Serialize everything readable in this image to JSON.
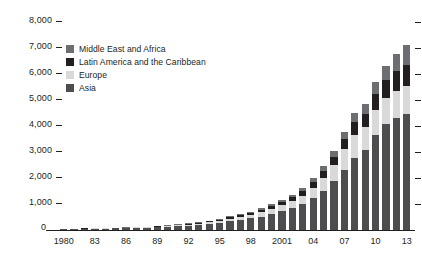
{
  "chart_data": {
    "type": "bar",
    "stacked": true,
    "title": "",
    "subtitle": "",
    "xlabel": "",
    "ylabel": "",
    "ylim": [
      0,
      8000
    ],
    "ytick_values": [
      1000,
      2000,
      3000,
      4000,
      5000,
      6000,
      7000,
      8000
    ],
    "ytick_labels": [
      "1,000",
      "2,000",
      "3,000",
      "4,000",
      "5,000",
      "6,000",
      "7,000",
      "8,000"
    ],
    "zero_label": "0",
    "grid": false,
    "ticks_both_sides": true,
    "legend_position": "upper-left-inside",
    "categories": [
      "1980",
      "1981",
      "1982",
      "1983",
      "1984",
      "1985",
      "1986",
      "1987",
      "1988",
      "1989",
      "1990",
      "1991",
      "1992",
      "1993",
      "1994",
      "1995",
      "1996",
      "1997",
      "1998",
      "1999",
      "2000",
      "2001",
      "2002",
      "2003",
      "2004",
      "2005",
      "2006",
      "2007",
      "2008",
      "2009",
      "2010",
      "2011",
      "2012",
      "2013"
    ],
    "xtick_labels": [
      {
        "index": 0,
        "label": "1980"
      },
      {
        "index": 3,
        "label": "83"
      },
      {
        "index": 6,
        "label": "86"
      },
      {
        "index": 9,
        "label": "89"
      },
      {
        "index": 12,
        "label": "92"
      },
      {
        "index": 15,
        "label": "95"
      },
      {
        "index": 18,
        "label": "98"
      },
      {
        "index": 21,
        "label": "2001"
      },
      {
        "index": 24,
        "label": "04"
      },
      {
        "index": 27,
        "label": "07"
      },
      {
        "index": 30,
        "label": "10"
      },
      {
        "index": 33,
        "label": "13"
      }
    ],
    "series": [
      {
        "name": "Asia",
        "color": "#4d4d4f",
        "stack_order": 0,
        "values": [
          20,
          24,
          28,
          33,
          38,
          44,
          52,
          62,
          74,
          88,
          105,
          124,
          148,
          178,
          215,
          262,
          320,
          385,
          430,
          500,
          600,
          700,
          820,
          980,
          1200,
          1500,
          1850,
          2300,
          2750,
          3050,
          3650,
          4050,
          4300,
          4450
        ]
      },
      {
        "name": "Europe",
        "color": "#d9d9d9",
        "stack_order": 1,
        "values": [
          6,
          7,
          8,
          9,
          11,
          13,
          15,
          18,
          22,
          26,
          31,
          37,
          44,
          53,
          64,
          78,
          95,
          115,
          135,
          160,
          190,
          225,
          265,
          320,
          400,
          500,
          620,
          780,
          900,
          880,
          950,
          1000,
          1030,
          1060
        ]
      },
      {
        "name": "Latin America and the Caribbean",
        "color": "#231f20",
        "stack_order": 2,
        "values": [
          3,
          3,
          4,
          5,
          6,
          7,
          8,
          10,
          12,
          14,
          17,
          20,
          24,
          29,
          35,
          43,
          52,
          63,
          74,
          88,
          105,
          125,
          148,
          178,
          215,
          265,
          330,
          410,
          490,
          520,
          620,
          700,
          760,
          820
        ]
      },
      {
        "name": "Middle East and Africa",
        "color": "#6d6e71",
        "stack_order": 3,
        "values": [
          2,
          2,
          3,
          3,
          4,
          5,
          6,
          7,
          8,
          10,
          12,
          14,
          17,
          20,
          24,
          29,
          36,
          43,
          51,
          61,
          73,
          87,
          103,
          124,
          150,
          185,
          225,
          280,
          340,
          370,
          450,
          540,
          650,
          780
        ]
      }
    ],
    "legend": [
      {
        "label": "Middle East and Africa",
        "color": "#6d6e71"
      },
      {
        "label": "Latin America and the Caribbean",
        "color": "#231f20"
      },
      {
        "label": "Europe",
        "color": "#d9d9d9"
      },
      {
        "label": "Asia",
        "color": "#4d4d4f"
      }
    ]
  }
}
